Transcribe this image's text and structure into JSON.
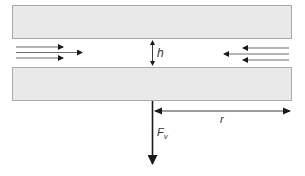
{
  "diagram": {
    "title": "",
    "plates": {
      "top": {
        "x": 12,
        "y": 5,
        "w": 280,
        "h": 34
      },
      "bottom": {
        "x": 12,
        "y": 67,
        "w": 280,
        "h": 34
      }
    },
    "labels": {
      "gap": "h",
      "radius": "r",
      "force": "F",
      "force_subscript": "v"
    },
    "flow_arrows": {
      "left": [
        {
          "y": 47,
          "x1": 16,
          "x2": 63
        },
        {
          "y": 52,
          "x1": 16,
          "x2": 82
        },
        {
          "y": 58,
          "x1": 16,
          "x2": 63
        }
      ],
      "right": [
        {
          "y": 48,
          "x1": 289,
          "x2": 243
        },
        {
          "y": 54,
          "x1": 289,
          "x2": 224
        },
        {
          "y": 60,
          "x1": 289,
          "x2": 243
        }
      ]
    },
    "colors": {
      "plate_fill": "#e9e9e9",
      "plate_border": "#a8a8a8",
      "arrow": "#1a1a1a"
    }
  }
}
